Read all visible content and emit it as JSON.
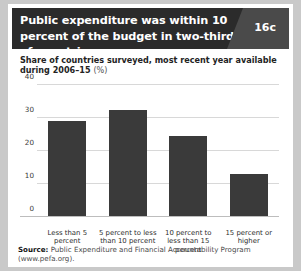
{
  "header": {
    "title": "Public expenditure was within 10 percent of the budget in two-thirds of countries",
    "badge": "16c"
  },
  "subtitle": {
    "text": "Share of countries surveyed, most recent year available during 2006–15",
    "unit": "(%)"
  },
  "source": {
    "label": "Source:",
    "text": " Public Expenditure and Financial Accountability Program (www.pefa.org)."
  },
  "chart_data": {
    "type": "bar",
    "title": "Public expenditure was within 10 percent of the budget in two-thirds of countries",
    "subtitle": "Share of countries surveyed, most recent year available during 2006–15 (%)",
    "categories": [
      "Less than 5 percent",
      "5 percent to less than 10 percent",
      "10 percent to less than 15 percent",
      "15 percent or higher"
    ],
    "values": [
      29,
      32.5,
      24.5,
      13
    ],
    "xlabel": "",
    "ylabel": "",
    "ylim": [
      0,
      40
    ],
    "yticks": [
      0,
      10,
      20,
      30,
      40
    ],
    "grid": true,
    "legend": false,
    "bar_color": "#3a3a3a"
  }
}
